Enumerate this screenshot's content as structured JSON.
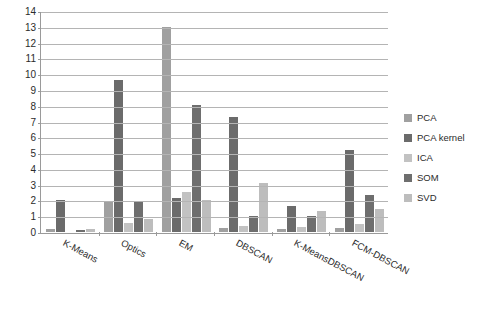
{
  "chart_data": {
    "type": "bar",
    "title": "",
    "subtitle": "",
    "xlabel": "",
    "ylabel": "",
    "ylim": [
      0,
      14
    ],
    "ytick_step": 1,
    "yticks": [
      0,
      1,
      2,
      3,
      4,
      5,
      6,
      7,
      8,
      9,
      10,
      11,
      12,
      13,
      14
    ],
    "grid": true,
    "legend_position": "right",
    "categories": [
      "K-Means",
      "Optics",
      "EM",
      "DBSCAN",
      "K-MeansDBSCAN",
      "FCM-DBSCAN"
    ],
    "series": [
      {
        "name": "PCA",
        "color": "#a0a0a0",
        "values": [
          0.18,
          1.9,
          13.0,
          0.28,
          0.2,
          0.25
        ]
      },
      {
        "name": "PCA kernel",
        "color": "#6b6b6b",
        "values": [
          2.03,
          9.65,
          2.15,
          7.3,
          1.63,
          5.2
        ]
      },
      {
        "name": "ICA",
        "color": "#c2c2c2",
        "values": [
          0.0,
          0.6,
          2.52,
          0.4,
          0.3,
          0.52
        ]
      },
      {
        "name": "SOM",
        "color": "#6e6e6e",
        "values": [
          0.1,
          1.9,
          8.03,
          1.0,
          1.0,
          2.32
        ]
      },
      {
        "name": "SVD",
        "color": "#bdbdbd",
        "values": [
          0.16,
          0.82,
          2.05,
          3.13,
          1.32,
          1.48
        ]
      }
    ]
  },
  "legend": {
    "items": [
      {
        "label": "PCA"
      },
      {
        "label": "PCA kernel"
      },
      {
        "label": "ICA"
      },
      {
        "label": "SOM"
      },
      {
        "label": "SVD"
      }
    ]
  }
}
